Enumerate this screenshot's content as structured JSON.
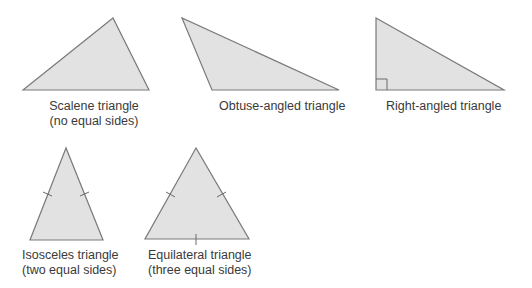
{
  "triangles": [
    {
      "id": "scalene",
      "line1": "Scalene triangle",
      "line2": "(no equal sides)"
    },
    {
      "id": "obtuse",
      "line1": "Obtuse-angled triangle",
      "line2": ""
    },
    {
      "id": "right",
      "line1": "Right-angled triangle",
      "line2": ""
    },
    {
      "id": "isosceles",
      "line1": "Isosceles triangle",
      "line2": "(two equal sides)"
    },
    {
      "id": "equilateral",
      "line1": "Equilateral triangle",
      "line2": "(three equal sides)"
    }
  ],
  "colors": {
    "fill": "#e2e2e2",
    "stroke": "#7a7a7a"
  }
}
